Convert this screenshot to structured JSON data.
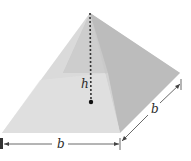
{
  "diagram": {
    "labels": {
      "height": "h",
      "base_front": "b",
      "base_side": "b"
    },
    "colors": {
      "background": "#ffffff",
      "face_front": "#dcdcdc",
      "face_left": "#ececec",
      "face_right": "#bdbdbd",
      "face_back": "#c9c9c9",
      "base_band": "#e4e4e4",
      "dashed_line": "#333333",
      "dimension_line": "#444444"
    }
  }
}
